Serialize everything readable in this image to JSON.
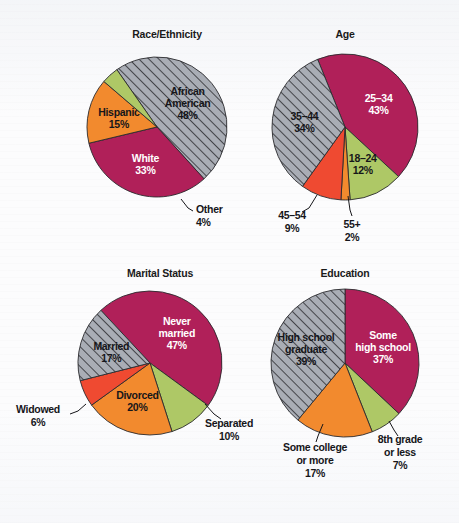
{
  "page": {
    "background_color": "#fcfcfd",
    "text_color": "#16161a",
    "outline_color": "#2a2a2e"
  },
  "palette": {
    "magenta": "#b02059",
    "gray_hatch": "#a9adb5",
    "hatch_line": "#2a2a2e",
    "orange": "#f28a2e",
    "green": "#aec866",
    "red": "#ef4a31",
    "white": "#ffffff"
  },
  "charts": [
    {
      "id": "race-ethnicity",
      "title": "Race/Ethnicity",
      "chart_data": {
        "type": "pie",
        "title": "Race/Ethnicity",
        "xlabel": "",
        "ylabel": "",
        "start_angle_deg": -35,
        "direction": "clockwise",
        "categories": [
          "African American",
          "White",
          "Hispanic",
          "Other"
        ],
        "values": [
          48,
          33,
          15,
          4
        ],
        "unit": "%",
        "slices": [
          {
            "label": "African American",
            "label_line1": "African",
            "label_line2": "American",
            "value": 48,
            "value_text": "48%",
            "color": "#a9adb5",
            "pattern": "diagonal-hatch",
            "label_placement": "inside",
            "label_color": "#16161a"
          },
          {
            "label": "White",
            "label_line1": "White",
            "label_line2": "",
            "value": 33,
            "value_text": "33%",
            "color": "#b02059",
            "pattern": "solid",
            "label_placement": "inside",
            "label_color": "#ffffff"
          },
          {
            "label": "Hispanic",
            "label_line1": "Hispanic",
            "label_line2": "",
            "value": 15,
            "value_text": "15%",
            "color": "#f28a2e",
            "pattern": "solid",
            "label_placement": "inside",
            "label_color": "#16161a"
          },
          {
            "label": "Other",
            "label_line1": "Other",
            "label_line2": "",
            "value": 4,
            "value_text": "4%",
            "color": "#aec866",
            "pattern": "solid",
            "label_placement": "outside",
            "label_color": "#16161a"
          }
        ]
      }
    },
    {
      "id": "age",
      "title": "Age",
      "chart_data": {
        "type": "pie",
        "title": "Age",
        "xlabel": "",
        "ylabel": "",
        "start_angle_deg": -22,
        "direction": "clockwise",
        "categories": [
          "25–34",
          "18–24",
          "55+",
          "45–54",
          "35–44"
        ],
        "values": [
          43,
          12,
          2,
          9,
          34
        ],
        "unit": "%",
        "slices": [
          {
            "label": "25–34",
            "label_line1": "25–34",
            "label_line2": "",
            "value": 43,
            "value_text": "43%",
            "color": "#b02059",
            "pattern": "solid",
            "label_placement": "inside",
            "label_color": "#ffffff"
          },
          {
            "label": "18–24",
            "label_line1": "18–24",
            "label_line2": "",
            "value": 12,
            "value_text": "12%",
            "color": "#aec866",
            "pattern": "solid",
            "label_placement": "inside",
            "label_color": "#16161a"
          },
          {
            "label": "55+",
            "label_line1": "55+",
            "label_line2": "",
            "value": 2,
            "value_text": "2%",
            "color": "#f28a2e",
            "pattern": "solid",
            "label_placement": "outside",
            "label_color": "#16161a"
          },
          {
            "label": "45–54",
            "label_line1": "45–54",
            "label_line2": "",
            "value": 9,
            "value_text": "9%",
            "color": "#ef4a31",
            "pattern": "solid",
            "label_placement": "outside",
            "label_color": "#16161a"
          },
          {
            "label": "35–44",
            "label_line1": "35–44",
            "label_line2": "",
            "value": 34,
            "value_text": "34%",
            "color": "#a9adb5",
            "pattern": "diagonal-hatch",
            "label_placement": "inside",
            "label_color": "#16161a"
          }
        ]
      }
    },
    {
      "id": "marital-status",
      "title": "Marital Status",
      "chart_data": {
        "type": "pie",
        "title": "Marital Status",
        "xlabel": "",
        "ylabel": "",
        "start_angle_deg": -43,
        "direction": "clockwise",
        "categories": [
          "Never married",
          "Separated",
          "Divorced",
          "Widowed",
          "Married"
        ],
        "values": [
          47,
          10,
          20,
          6,
          17
        ],
        "unit": "%",
        "slices": [
          {
            "label": "Never married",
            "label_line1": "Never",
            "label_line2": "married",
            "value": 47,
            "value_text": "47%",
            "color": "#b02059",
            "pattern": "solid",
            "label_placement": "inside",
            "label_color": "#ffffff"
          },
          {
            "label": "Separated",
            "label_line1": "Separated",
            "label_line2": "",
            "value": 10,
            "value_text": "10%",
            "color": "#aec866",
            "pattern": "solid",
            "label_placement": "outside",
            "label_color": "#16161a"
          },
          {
            "label": "Divorced",
            "label_line1": "Divorced",
            "label_line2": "",
            "value": 20,
            "value_text": "20%",
            "color": "#f28a2e",
            "pattern": "solid",
            "label_placement": "inside",
            "label_color": "#16161a"
          },
          {
            "label": "Widowed",
            "label_line1": "Widowed",
            "label_line2": "",
            "value": 6,
            "value_text": "6%",
            "color": "#ef4a31",
            "pattern": "solid",
            "label_placement": "outside",
            "label_color": "#16161a"
          },
          {
            "label": "Married",
            "label_line1": "Married",
            "label_line2": "",
            "value": 17,
            "value_text": "17%",
            "color": "#a9adb5",
            "pattern": "diagonal-hatch",
            "label_placement": "inside",
            "label_color": "#16161a"
          }
        ]
      }
    },
    {
      "id": "education",
      "title": "Education",
      "chart_data": {
        "type": "pie",
        "title": "Education",
        "xlabel": "",
        "ylabel": "",
        "start_angle_deg": 0,
        "direction": "clockwise",
        "categories": [
          "Some high school",
          "8th grade or less",
          "Some college or more",
          "High school graduate"
        ],
        "values": [
          37,
          7,
          17,
          39
        ],
        "unit": "%",
        "slices": [
          {
            "label": "Some high school",
            "label_line1": "Some",
            "label_line2": "high school",
            "value": 37,
            "value_text": "37%",
            "color": "#b02059",
            "pattern": "solid",
            "label_placement": "inside",
            "label_color": "#ffffff"
          },
          {
            "label": "8th grade or less",
            "label_line1": "8th grade",
            "label_line2": "or less",
            "value": 7,
            "value_text": "7%",
            "color": "#aec866",
            "pattern": "solid",
            "label_placement": "outside",
            "label_color": "#16161a"
          },
          {
            "label": "Some college or more",
            "label_line1": "Some college",
            "label_line2": "or more",
            "value": 17,
            "value_text": "17%",
            "color": "#f28a2e",
            "pattern": "solid",
            "label_placement": "outside",
            "label_color": "#16161a"
          },
          {
            "label": "High school graduate",
            "label_line1": "High school",
            "label_line2": "graduate",
            "value": 39,
            "value_text": "39%",
            "color": "#a9adb5",
            "pattern": "diagonal-hatch",
            "label_placement": "inside",
            "label_color": "#16161a"
          }
        ]
      }
    }
  ],
  "layout": {
    "panels": [
      {
        "id": "race-ethnicity",
        "title_x": 167,
        "title_y": 28,
        "cx": 157,
        "cy": 127,
        "r": 70
      },
      {
        "id": "age",
        "title_x": 345,
        "title_y": 28,
        "cx": 345,
        "cy": 127,
        "r": 73
      },
      {
        "id": "marital-status",
        "title_x": 160,
        "title_y": 267,
        "cx": 150,
        "cy": 363,
        "r": 72
      },
      {
        "id": "education",
        "title_x": 345,
        "title_y": 267,
        "cx": 345,
        "cy": 363,
        "r": 74
      }
    ],
    "outside_labels": [
      {
        "chart": "race-ethnicity",
        "label": "Other",
        "lines": [
          "Other",
          "4%"
        ],
        "x": 196,
        "y": 213,
        "anchor": "start",
        "leader": [
          [
            181,
            199
          ],
          [
            188,
            208
          ],
          [
            193,
            211
          ]
        ]
      },
      {
        "chart": "age",
        "label": "45–54",
        "lines": [
          "45–54",
          "9%"
        ],
        "x": 292,
        "y": 219,
        "anchor": "middle",
        "leader": [
          [
            317,
            195
          ],
          [
            309,
            208
          ],
          [
            302,
            212
          ]
        ]
      },
      {
        "chart": "age",
        "label": "55+",
        "lines": [
          "55+",
          "2%"
        ],
        "x": 352,
        "y": 228,
        "anchor": "middle",
        "leader": [
          [
            348,
            196
          ],
          [
            350,
            210
          ],
          [
            352,
            216
          ]
        ]
      },
      {
        "chart": "marital-status",
        "label": "Widowed",
        "lines": [
          "Widowed",
          "6%"
        ],
        "x": 38,
        "y": 413,
        "anchor": "middle",
        "leader": [
          [
            86,
            404
          ],
          [
            78,
            411
          ],
          [
            70,
            414
          ]
        ]
      },
      {
        "chart": "marital-status",
        "label": "Separated",
        "lines": [
          "Separated",
          "10%"
        ],
        "x": 229,
        "y": 427,
        "anchor": "middle",
        "leader": [
          [
            205,
            404
          ],
          [
            214,
            414
          ],
          [
            221,
            419
          ]
        ]
      },
      {
        "chart": "education",
        "label": "Some college or more",
        "lines": [
          "Some college",
          "or more",
          "17%"
        ],
        "x": 315,
        "y": 451,
        "anchor": "middle",
        "leader": [
          [
            323,
            424
          ],
          [
            318,
            436
          ],
          [
            316,
            442
          ]
        ]
      },
      {
        "chart": "education",
        "label": "8th grade or less",
        "lines": [
          "8th grade",
          "or less",
          "7%"
        ],
        "x": 400,
        "y": 443,
        "anchor": "middle",
        "leader": [
          [
            389,
            421
          ],
          [
            394,
            430
          ],
          [
            398,
            436
          ]
        ]
      }
    ]
  }
}
